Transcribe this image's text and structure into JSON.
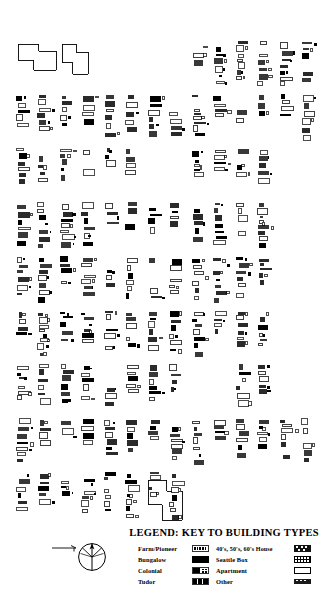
{
  "document": {
    "kind": "historic-building-footprint-map",
    "orientation_marker": "north-arrow-compass-rose",
    "scale_bar_present": true
  },
  "legend": {
    "title": "LEGEND: KEY TO BUILDING TYPES",
    "columns": [
      {
        "items": [
          {
            "label": "Farm/Pioneer",
            "swatch": "outline-hatched-rect"
          },
          {
            "label": "Bungalow",
            "swatch": "solid-black-rect"
          },
          {
            "label": "Colonial",
            "swatch": "half-filled-rect"
          },
          {
            "label": "Tudor",
            "swatch": "segmented-rect"
          }
        ]
      },
      {
        "items": [
          {
            "label": "40's, 50's, 60's House",
            "swatch": "dark-speckled-rect"
          },
          {
            "label": "Seattle Box",
            "swatch": "gridded-rect"
          },
          {
            "label": "Apartment",
            "swatch": "empty-outline-rect"
          },
          {
            "label": "Other",
            "swatch": "solid-dark-rect"
          }
        ]
      }
    ]
  },
  "map": {
    "background_color": "#ffffff",
    "ink_color": "#000000",
    "blocks_description": "Grid of city blocks filled with small rectangular building footprints of varying fill",
    "grid": {
      "columns": 7,
      "rows": 9,
      "left": 16,
      "top": 40,
      "col_width": 44,
      "row_height": 54,
      "block_width": 38,
      "block_height": 46
    },
    "seed": 20240117,
    "fill_styles": [
      "solid",
      "outline",
      "half",
      "hatch",
      "dark"
    ],
    "landmarks": [
      {
        "name": "large-outline-structure-top-left",
        "x": 18,
        "y": 44,
        "w": 38,
        "h": 26
      },
      {
        "name": "irregular-outline-structure",
        "x": 62,
        "y": 44,
        "w": 26,
        "h": 30
      },
      {
        "name": "large-outline-structure-bottom-right",
        "x": 148,
        "y": 480,
        "w": 34,
        "h": 40
      }
    ]
  }
}
